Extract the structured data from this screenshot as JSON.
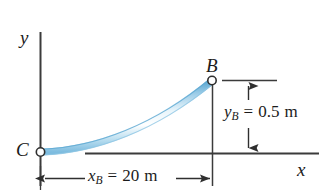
{
  "figure": {
    "background_color": "#ffffff",
    "line_color": "#3b3b3b",
    "cable_color_light": "#d8edf8",
    "cable_color_mid": "#8fc6e4",
    "cable_color_dark": "#4a9bc8"
  },
  "axes": {
    "y_label": "y",
    "x_label": "x"
  },
  "points": {
    "b_label": "B",
    "c_label": "C"
  },
  "dimensions": {
    "vertical": {
      "symbol": "y",
      "subscript": "B",
      "equals": "=",
      "value": "0.5",
      "unit": "m",
      "full_text": "y_B = 0.5 m"
    },
    "horizontal": {
      "symbol": "x",
      "subscript": "B",
      "equals": "=",
      "value": "20",
      "unit": "m",
      "full_text": "x_B = 20 m"
    }
  }
}
